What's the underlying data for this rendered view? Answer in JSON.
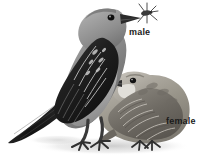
{
  "figure": {
    "kind": "field-guide-illustration",
    "background_color": "#ffffff",
    "label_color": "#1b1b1b",
    "ground_shadow_color": "#d9d9d9"
  },
  "labels": {
    "male": "male",
    "female": "female"
  },
  "birds": [
    {
      "id": "male-bird",
      "label": "male",
      "position": "upper-left, standing upright facing right",
      "plumage_description": "slate-gray head, nape and breast; blackish wings with pale feather fringes; blackish tail; holding an insect in the bill",
      "colors": {
        "head": "#8c8c8c",
        "back": "#7a7a7a",
        "wing": "#242424",
        "wing_fringe": "#cfcfcf",
        "breast": "#9a9a9a",
        "belly": "#bdbdbd",
        "tail": "#1c1c1c",
        "bill": "#2b2b2b",
        "eye": "#111111",
        "leg": "#3a3a3a"
      },
      "holds_prey": true,
      "prey": "insect"
    },
    {
      "id": "female-bird",
      "label": "female",
      "position": "lower-right, crouched facing left",
      "plumage_description": "pale buff-gray head with whitish throat; scalloped brown-gray upperparts; paler underparts",
      "colors": {
        "head": "#b4b0a8",
        "throat": "#e2e0da",
        "back": "#8e8a82",
        "wing": "#6f6b64",
        "wing_fringe": "#cac6be",
        "breast": "#a8a49c",
        "tail": "#6b6760",
        "bill": "#2f2f2f",
        "eye": "#111111",
        "leg": "#3a3a3a"
      },
      "holds_prey": false,
      "prey": null
    }
  ]
}
